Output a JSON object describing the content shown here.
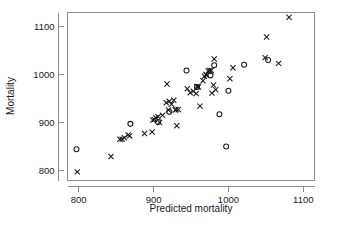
{
  "chart_data": {
    "type": "scatter",
    "title": "",
    "xlabel": "Predicted mortality",
    "ylabel": "Mortality",
    "xlim": [
      785,
      1115
    ],
    "ylim": [
      780,
      1130
    ],
    "xticks": [
      800,
      900,
      1000,
      1100
    ],
    "yticks": [
      800,
      900,
      1000,
      1100
    ],
    "xtick_labels": [
      "800",
      "900",
      "1000",
      "1100"
    ],
    "ytick_labels": [
      "800",
      "900",
      "1000",
      "1100"
    ],
    "grid": false,
    "legend": null,
    "series": [
      {
        "name": "x-marker",
        "marker": "x",
        "color": "#1a1a1a",
        "points": [
          [
            798,
            798
          ],
          [
            843,
            830
          ],
          [
            855,
            866
          ],
          [
            858,
            866
          ],
          [
            861,
            869
          ],
          [
            866,
            875
          ],
          [
            868,
            873
          ],
          [
            888,
            878
          ],
          [
            898,
            881
          ],
          [
            899,
            906
          ],
          [
            901,
            907
          ],
          [
            903,
            911
          ],
          [
            906,
            913
          ],
          [
            908,
            901
          ],
          [
            912,
            916
          ],
          [
            917,
            942
          ],
          [
            918,
            981
          ],
          [
            920,
            927
          ],
          [
            921,
            945
          ],
          [
            924,
            939
          ],
          [
            927,
            947
          ],
          [
            929,
            927
          ],
          [
            930,
            928
          ],
          [
            931,
            894
          ],
          [
            933,
            928
          ],
          [
            945,
            971
          ],
          [
            949,
            963
          ],
          [
            953,
            966
          ],
          [
            957,
            961
          ],
          [
            958,
            976
          ],
          [
            959,
            975
          ],
          [
            960,
            975
          ],
          [
            962,
            935
          ],
          [
            966,
            988
          ],
          [
            968,
            997
          ],
          [
            970,
            1001
          ],
          [
            971,
            999
          ],
          [
            973,
            1008
          ],
          [
            975,
            1009
          ],
          [
            977,
            1009
          ],
          [
            978,
            962
          ],
          [
            980,
            979
          ],
          [
            981,
            1033
          ],
          [
            983,
            969
          ],
          [
            1002,
            992
          ],
          [
            1006,
            1015
          ],
          [
            1049,
            1036
          ],
          [
            1051,
            1079
          ],
          [
            1067,
            1024
          ],
          [
            1081,
            1120
          ]
        ]
      },
      {
        "name": "o-marker",
        "marker": "o",
        "color": "#1a1a1a",
        "points": [
          [
            797,
            845
          ],
          [
            869,
            898
          ],
          [
            906,
            902
          ],
          [
            921,
            923
          ],
          [
            944,
            1009
          ],
          [
            958,
            975
          ],
          [
            976,
            999
          ],
          [
            981,
            1020
          ],
          [
            988,
            918
          ],
          [
            997,
            851
          ],
          [
            1000,
            967
          ],
          [
            1021,
            1021
          ],
          [
            1053,
            1031
          ]
        ]
      }
    ]
  }
}
